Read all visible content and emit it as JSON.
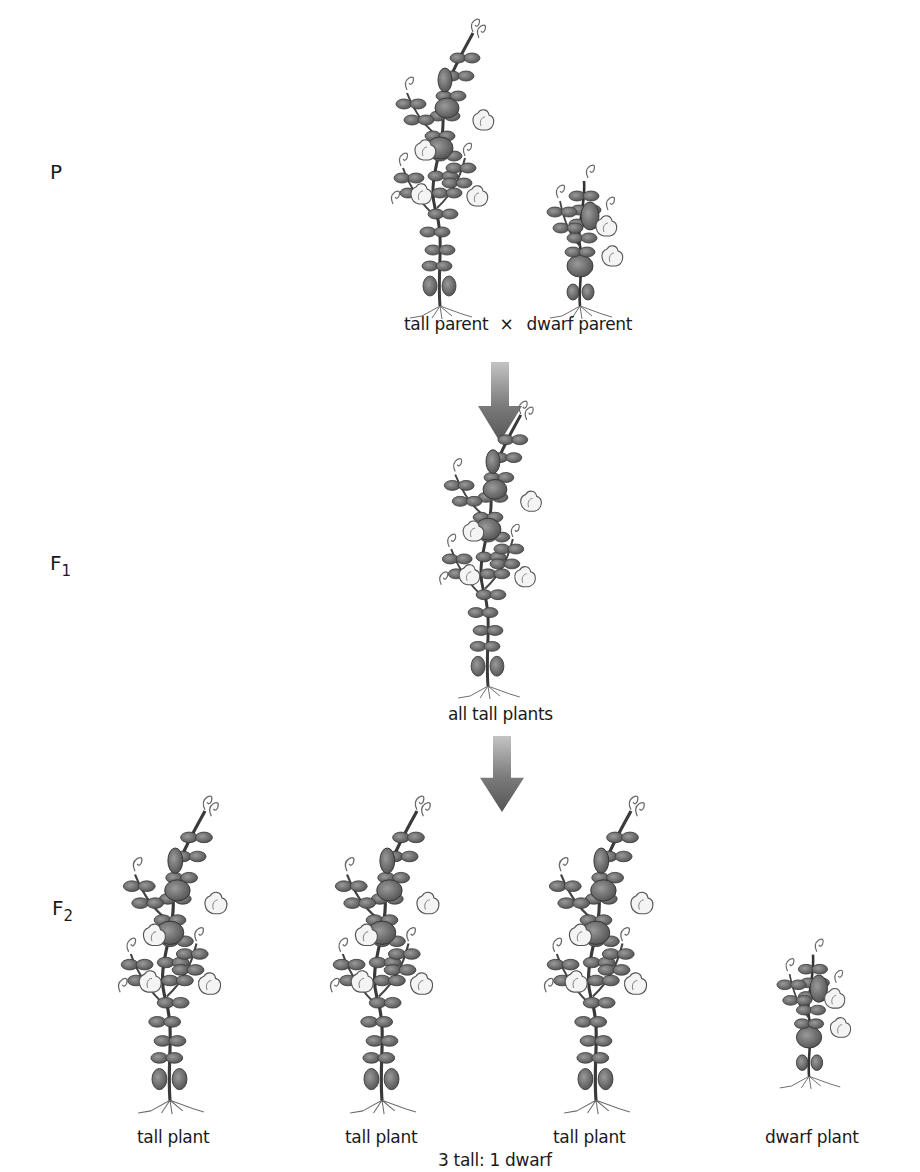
{
  "generations": {
    "p": {
      "label": "P",
      "sub": ""
    },
    "f1": {
      "label": "F",
      "sub": "1"
    },
    "f2": {
      "label": "F",
      "sub": "2"
    }
  },
  "p_row": {
    "cross_left": "tall parent",
    "cross_symbol": "×",
    "cross_right": "dwarf parent"
  },
  "f1_row": {
    "caption": "all tall plants"
  },
  "f2_row": {
    "plants": [
      {
        "label": "tall plant",
        "type": "tall"
      },
      {
        "label": "tall plant",
        "type": "tall"
      },
      {
        "label": "tall plant",
        "type": "tall"
      },
      {
        "label": "dwarf plant",
        "type": "dwarf"
      }
    ],
    "ratio": "3 tall: 1 dwarf"
  },
  "colors": {
    "plant_dark": "#4a4a4a",
    "plant_mid": "#7a7a7a",
    "plant_light": "#a8a8a8",
    "arrow_top": "#b8b8b8",
    "arrow_bottom": "#5e5e5e",
    "text": "#1a1a1a"
  }
}
